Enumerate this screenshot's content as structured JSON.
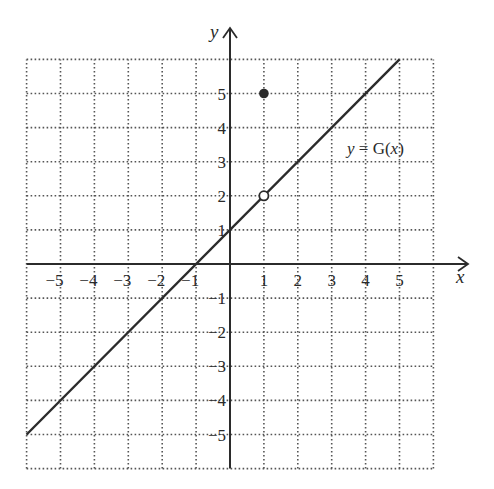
{
  "chart_data": {
    "type": "line",
    "title": "",
    "xlabel": "x",
    "ylabel": "y",
    "xlim": [
      -6,
      6
    ],
    "ylim": [
      -6,
      6
    ],
    "grid": true,
    "grid_style": "dotted",
    "x_ticks": [
      -5,
      -4,
      -3,
      -2,
      -1,
      1,
      2,
      3,
      4,
      5
    ],
    "y_ticks": [
      -5,
      -4,
      -3,
      -2,
      -1,
      1,
      2,
      3,
      4,
      5
    ],
    "x_tick_labels": [
      "−5",
      "−4",
      "−3",
      "−2",
      "−1",
      "1",
      "2",
      "3",
      "4",
      "5"
    ],
    "y_tick_labels": [
      "−5",
      "−4",
      "−3",
      "−2",
      "−1",
      "1",
      "2",
      "3",
      "4",
      "5"
    ],
    "series": [
      {
        "name": "y = G(x)",
        "equation": "y = x + 1",
        "x": [
          -6,
          5
        ],
        "y": [
          -5,
          6
        ]
      }
    ],
    "points": [
      {
        "x": 1,
        "y": 2,
        "style": "open",
        "note": "hole in line"
      },
      {
        "x": 1,
        "y": 5,
        "style": "filled",
        "note": "G(1) = 5"
      }
    ],
    "annotations": [
      {
        "text": "y = G(x)",
        "x": 3.4,
        "y": 3.2
      }
    ]
  },
  "labels": {
    "x_axis": "x",
    "y_axis": "y",
    "function": "y = G(x)"
  },
  "colors": {
    "line": "#2b2b2b",
    "grid": "#555555",
    "text": "#2a2a2a"
  }
}
